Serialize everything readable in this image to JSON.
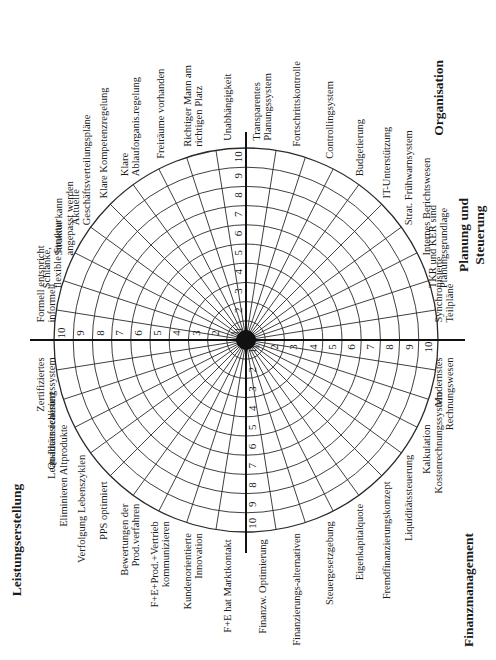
{
  "diagram": {
    "type": "polar-assessment-grid",
    "rings": 10,
    "scale": [
      "1",
      "2",
      "3",
      "4",
      "5",
      "6",
      "7",
      "8",
      "9",
      "10"
    ],
    "quadrants": [
      {
        "title": "Organisation",
        "criteria": [
          "Formell entspricht informell",
          "Schlanke, flexible Struktur",
          "Struktur kann angepasst werden",
          "Aktuelle Geschäftsverteilungspläne",
          "Klare Kompetenzregelung",
          "Klare Ablauforganis.regelung",
          "Freiräume vorhanden",
          "Richtiger Mann am richtigen Platz",
          "Unabhängigkeit"
        ]
      },
      {
        "title": "Planung und Steuerung",
        "criteria": [
          "Transparentes Planungssystem",
          "Fortschrittskontrolle",
          "Controllingsystem",
          "Budgetierung",
          "IT-Unterstützung",
          "Strat. Frühwarnsystem",
          "Internes Berichtswesen",
          "TKR und KER sind Planungsgrundlage",
          "Synchronisierte Teilpläne"
        ]
      },
      {
        "title": "Finanzmanagement",
        "criteria": [
          "Modernstes Rechnungswesen",
          "Kostenrechnungssystem",
          "Kalkulation",
          "Liquiditätssteuerung",
          "Fremdfinanzierungskonzept",
          "Eigenkapitalquote",
          "Steuergesetzgebung",
          "Finanzierungs-alternativen",
          "Finanzw. Optimierung"
        ]
      },
      {
        "title": "Leistungserstellung",
        "criteria": [
          "F+E hat Marktkontakt",
          "Kundenorientierte Innovation",
          "F+E+Prod.+Vertrieb kommunizieren",
          "Bewertungen der Prod.verfahren",
          "PPS optimiert",
          "Verfolgung Lebenszyklen",
          "Eliminieren Altprodukte",
          "Lean-Ideen realisiert",
          "Zertifiziertes Qualitätssicherungssystem"
        ]
      }
    ],
    "colors": {
      "line": "#2a2a2a",
      "text": "#1a1a1a",
      "background": "#ffffff"
    }
  }
}
